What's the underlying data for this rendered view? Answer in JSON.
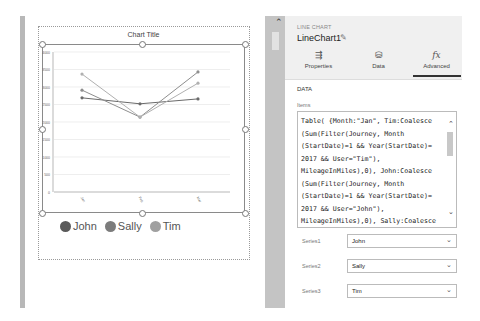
{
  "canvas": {
    "chart_title": "Chart Title",
    "legend": [
      {
        "label": "John",
        "color": "#5a5a5a"
      },
      {
        "label": "Sally",
        "color": "#7c7c7c"
      },
      {
        "label": "Tim",
        "color": "#a0a0a0"
      }
    ]
  },
  "chart_data": {
    "type": "line",
    "title": "Chart Title",
    "categories": [
      "Jan",
      "Feb",
      "Mar"
    ],
    "ylim": [
      0,
      4000
    ],
    "yticks": [
      "0",
      "500",
      "1000",
      "1500",
      "2000",
      "2500",
      "3000",
      "3500",
      "4000"
    ],
    "grid": true,
    "legend_position": "bottom-left",
    "series": [
      {
        "name": "John",
        "color": "#6a6a6a",
        "values": [
          2690,
          2520,
          2660
        ]
      },
      {
        "name": "Sally",
        "color": "#8e8e8e",
        "values": [
          2910,
          2140,
          3430
        ]
      },
      {
        "name": "Tim",
        "color": "#b0b0b0",
        "values": [
          3370,
          2140,
          3110
        ]
      }
    ]
  },
  "panel": {
    "control_type": "LINE CHART",
    "control_name": "LineChart1",
    "tabs": [
      {
        "label": "Properties",
        "icon": "sliders-icon",
        "glyph": "⇶"
      },
      {
        "label": "Data",
        "icon": "database-icon",
        "glyph": "⛁"
      },
      {
        "label": "Advanced",
        "icon": "fx-icon",
        "glyph": "fx",
        "active": true
      }
    ],
    "section_title": "DATA",
    "items_label": "Items",
    "items_formula": "Table( {Month:\"Jan\", Tim:Coalesce\n(Sum(Filter(Journey, Month\n(StartDate)=1 && Year(StartDate)=\n2017 && User=\"Tim\"),\nMileageInMiles),0), John:Coalesce\n(Sum(Filter(Journey, Month\n(StartDate)=1 && Year(StartDate)=\n2017 && User=\"John\"),\nMileageInMiles),0), Sally:Coalesce\n(Sum(Filter(Journey, Month",
    "series": [
      {
        "label": "Series1",
        "value": "John"
      },
      {
        "label": "Series2",
        "value": "Sally"
      },
      {
        "label": "Series3",
        "value": "Tim"
      }
    ]
  }
}
